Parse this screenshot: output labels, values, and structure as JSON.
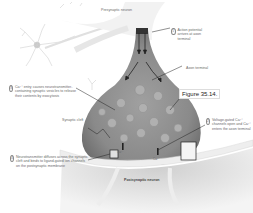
{
  "figure": {
    "tag": "Figure 35.14."
  },
  "labels": {
    "presynaptic_neuron": "Presynaptic neuron",
    "axon_terminal": "Axon terminal",
    "synaptic_cleft": "Synaptic cleft",
    "postsynaptic_neuron": "Postsynaptic neuron",
    "ca_left": "Ca²⁺",
    "ca_right": "Ca²⁺"
  },
  "steps": [
    {
      "number": "1",
      "text": "Action potential arrives at axon terminal"
    },
    {
      "number": "2",
      "text": "Voltage-gated Ca²⁺ channels open and Ca²⁺ enters the axon terminal"
    },
    {
      "number": "3",
      "text": "Ca²⁺ entry causes neurotransmitter-containing synaptic vesicles to release their contents by exocytosis"
    },
    {
      "number": "4",
      "text": "Neurotransmitter diffuses across the synaptic cleft and binds to ligand-gated ion channels on the postsynaptic membrane"
    }
  ],
  "colors": {
    "terminal_fill": "#8c8c8c",
    "terminal_light": "#c8c8c8",
    "post_fill": "#d4d4d4",
    "membrane": "#ececec",
    "vesicle": "#a8a8a8",
    "line": "#222222"
  }
}
